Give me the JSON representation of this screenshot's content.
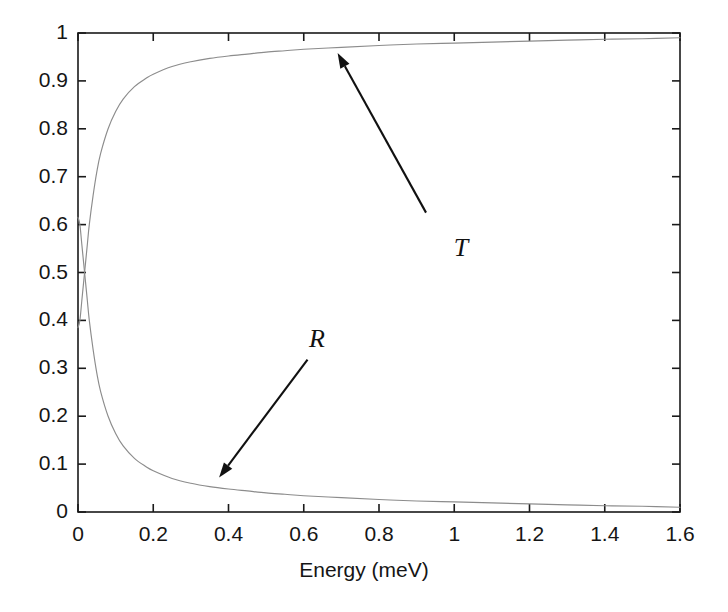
{
  "chart_data": {
    "type": "line",
    "title": "",
    "subtitle": "",
    "xlabel": "Energy (meV)",
    "ylabel": "",
    "xlim": [
      0,
      1.6
    ],
    "ylim": [
      0,
      1
    ],
    "xticks": [
      "0",
      "0.2",
      "0.4",
      "0.6",
      "0.8",
      "1",
      "1.2",
      "1.4",
      "1.6"
    ],
    "xtick_values": [
      0,
      0.2,
      0.4,
      0.6,
      0.8,
      1.0,
      1.2,
      1.4,
      1.6
    ],
    "yticks": [
      "0",
      "0.1",
      "0.2",
      "0.3",
      "0.4",
      "0.5",
      "0.6",
      "0.7",
      "0.8",
      "0.9",
      "1"
    ],
    "ytick_values": [
      0,
      0.1,
      0.2,
      0.3,
      0.4,
      0.5,
      0.6,
      0.7,
      0.8,
      0.9,
      1.0
    ],
    "grid": false,
    "legend": "none",
    "line_color": "#8c8c8c",
    "axis_color": "#1a1a1a",
    "annotation_color": "#111111",
    "background": "#ffffff",
    "series": [
      {
        "name": "T",
        "label": "T",
        "description": "Transmission coefficient, rises sharply from 0.38 to near 1",
        "x": [
          0,
          0.005,
          0.01,
          0.015,
          0.02,
          0.025,
          0.03,
          0.04,
          0.05,
          0.06,
          0.08,
          0.1,
          0.12,
          0.15,
          0.18,
          0.2,
          0.25,
          0.3,
          0.35,
          0.4,
          0.45,
          0.5,
          0.55,
          0.6,
          0.7,
          0.8,
          0.9,
          1.0,
          1.1,
          1.2,
          1.3,
          1.4,
          1.5,
          1.6
        ],
        "values": [
          0.385,
          0.4,
          0.44,
          0.48,
          0.52,
          0.56,
          0.6,
          0.66,
          0.71,
          0.748,
          0.8,
          0.836,
          0.862,
          0.888,
          0.905,
          0.914,
          0.93,
          0.94,
          0.947,
          0.952,
          0.956,
          0.96,
          0.963,
          0.966,
          0.97,
          0.974,
          0.977,
          0.979,
          0.981,
          0.983,
          0.985,
          0.987,
          0.988,
          0.99
        ]
      },
      {
        "name": "R",
        "label": "R",
        "description": "Reflection coefficient, decays from 0.62 toward 0",
        "x": [
          0,
          0.005,
          0.01,
          0.015,
          0.02,
          0.025,
          0.03,
          0.04,
          0.05,
          0.06,
          0.08,
          0.1,
          0.12,
          0.15,
          0.18,
          0.2,
          0.25,
          0.3,
          0.35,
          0.4,
          0.45,
          0.5,
          0.55,
          0.6,
          0.7,
          0.8,
          0.9,
          1.0,
          1.1,
          1.2,
          1.3,
          1.4,
          1.5,
          1.6
        ],
        "values": [
          0.615,
          0.6,
          0.56,
          0.52,
          0.48,
          0.44,
          0.4,
          0.34,
          0.29,
          0.252,
          0.2,
          0.164,
          0.138,
          0.112,
          0.095,
          0.086,
          0.07,
          0.06,
          0.053,
          0.048,
          0.044,
          0.04,
          0.037,
          0.034,
          0.03,
          0.026,
          0.023,
          0.021,
          0.019,
          0.017,
          0.015,
          0.013,
          0.012,
          0.01
        ]
      }
    ],
    "annotations": [
      {
        "name": "T",
        "text": "T",
        "label_x": 1.02,
        "label_y": 0.545,
        "arrow_from_x": 0.925,
        "arrow_from_y": 0.625,
        "arrow_to_x": 0.69,
        "arrow_to_y": 0.958
      },
      {
        "name": "R",
        "text": "R",
        "label_x": 0.635,
        "label_y": 0.355,
        "arrow_from_x": 0.61,
        "arrow_from_y": 0.318,
        "arrow_to_x": 0.375,
        "arrow_to_y": 0.072
      }
    ]
  }
}
